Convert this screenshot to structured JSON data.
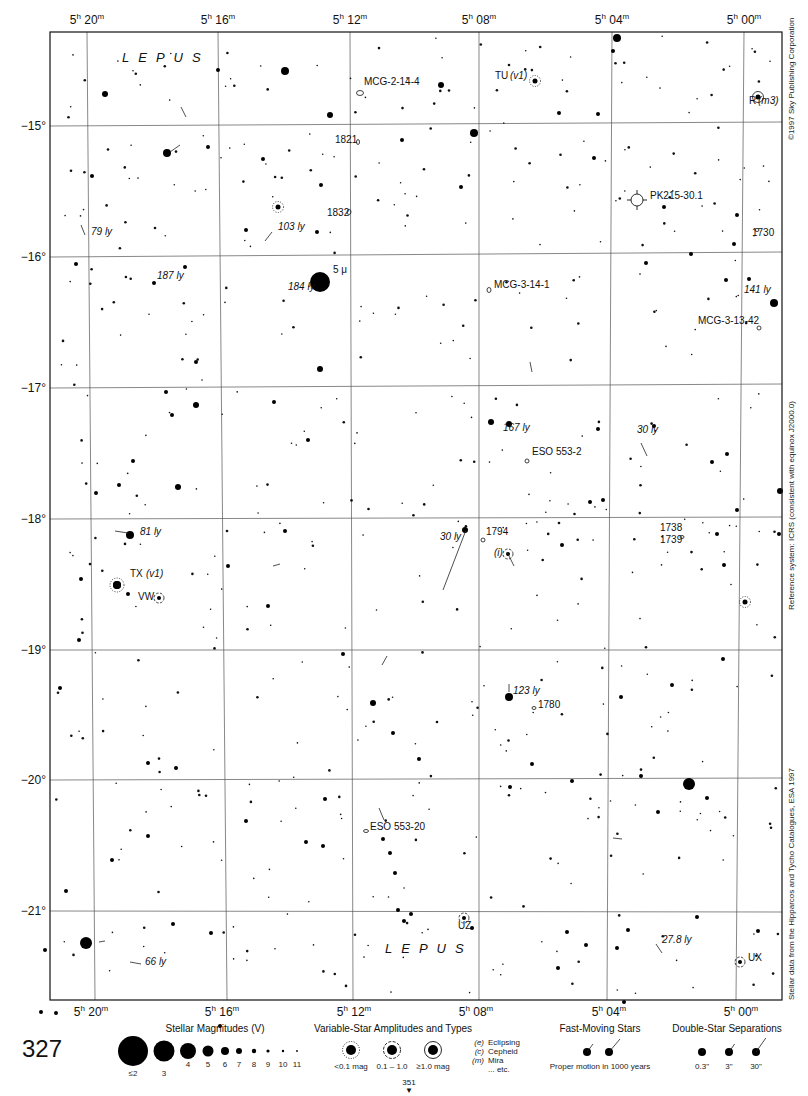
{
  "chart_data": {
    "type": "star-chart",
    "page_number": "327",
    "next_page": "351",
    "constellation": "LEPUS",
    "ra_labels": [
      {
        "h": "5",
        "m": "20",
        "x": 87
      },
      {
        "h": "5",
        "m": "16",
        "x": 218
      },
      {
        "h": "5",
        "m": "12",
        "x": 350
      },
      {
        "h": "5",
        "m": "08",
        "x": 479
      },
      {
        "h": "5",
        "m": "04",
        "x": 612
      },
      {
        "h": "5",
        "m": "00",
        "x": 744
      }
    ],
    "dec_labels": [
      {
        "label": "−15°",
        "y": 126
      },
      {
        "label": "−16°",
        "y": 257
      },
      {
        "label": "−17°",
        "y": 388
      },
      {
        "label": "−18°",
        "y": 519
      },
      {
        "label": "−19°",
        "y": 650
      },
      {
        "label": "−20°",
        "y": 780
      },
      {
        "label": "−21°",
        "y": 911
      }
    ],
    "frame": {
      "x": 50,
      "y": 32,
      "w": 732,
      "h": 968
    },
    "labels": [
      {
        "text": "LEPUS",
        "x": 122,
        "y": 50,
        "type": "constellation"
      },
      {
        "text": "LEPUS",
        "x": 385,
        "y": 941,
        "type": "constellation"
      },
      {
        "text": "MCG-2-14-4",
        "x": 364,
        "y": 82,
        "italic": false
      },
      {
        "text": "TU",
        "x": 495,
        "y": 76,
        "italic": false
      },
      {
        "text": "(v1)",
        "x": 510,
        "y": 76,
        "italic": true
      },
      {
        "text": "R",
        "x": 749,
        "y": 101,
        "italic": false
      },
      {
        "text": "(m3)",
        "x": 758,
        "y": 101,
        "italic": true
      },
      {
        "text": "1821",
        "x": 335,
        "y": 140,
        "italic": false
      },
      {
        "text": "1832",
        "x": 327,
        "y": 213,
        "italic": false
      },
      {
        "text": "PK215-30.1",
        "x": 650,
        "y": 196,
        "italic": false
      },
      {
        "text": "1730",
        "x": 752,
        "y": 233,
        "italic": false
      },
      {
        "text": "79 ly",
        "x": 91,
        "y": 232,
        "italic": true
      },
      {
        "text": "103 ly",
        "x": 278,
        "y": 227,
        "italic": true
      },
      {
        "text": "5 μ",
        "x": 333,
        "y": 270,
        "italic": false
      },
      {
        "text": "184 ly",
        "x": 288,
        "y": 287,
        "italic": true
      },
      {
        "text": "187 ly",
        "x": 157,
        "y": 276,
        "italic": true
      },
      {
        "text": "MCG-3-14-1",
        "x": 494,
        "y": 285,
        "italic": false
      },
      {
        "text": "141 ly",
        "x": 744,
        "y": 290,
        "italic": true
      },
      {
        "text": "MCG-3-13-42",
        "x": 698,
        "y": 321,
        "italic": false
      },
      {
        "text": "167 ly",
        "x": 503,
        "y": 428,
        "italic": true
      },
      {
        "text": "30 ly",
        "x": 637,
        "y": 430,
        "italic": true
      },
      {
        "text": "ESO 553-2",
        "x": 532,
        "y": 452,
        "italic": false
      },
      {
        "text": "81 ly",
        "x": 140,
        "y": 532,
        "italic": true
      },
      {
        "text": "30 ly",
        "x": 440,
        "y": 537,
        "italic": true
      },
      {
        "text": "1794",
        "x": 486,
        "y": 532,
        "italic": false
      },
      {
        "text": "(i)",
        "x": 494,
        "y": 553,
        "italic": true
      },
      {
        "text": "1738",
        "x": 660,
        "y": 528,
        "italic": false
      },
      {
        "text": "1739",
        "x": 660,
        "y": 540,
        "italic": false
      },
      {
        "text": "TX",
        "x": 130,
        "y": 574,
        "italic": false
      },
      {
        "text": "(v1)",
        "x": 146,
        "y": 574,
        "italic": true
      },
      {
        "text": "VW",
        "x": 138,
        "y": 597,
        "italic": false
      },
      {
        "text": "123 ly",
        "x": 513,
        "y": 691,
        "italic": true
      },
      {
        "text": "1780",
        "x": 538,
        "y": 705,
        "italic": false
      },
      {
        "text": "ESO 553-20",
        "x": 370,
        "y": 827,
        "italic": false
      },
      {
        "text": "UZ",
        "x": 458,
        "y": 926,
        "italic": false
      },
      {
        "text": "27.8 ly",
        "x": 662,
        "y": 940,
        "italic": true
      },
      {
        "text": "66 ly",
        "x": 145,
        "y": 962,
        "italic": true
      },
      {
        "text": "UX",
        "x": 748,
        "y": 958,
        "italic": false
      }
    ],
    "stars": [
      [
        320,
        282,
        10
      ],
      [
        689,
        784,
        6
      ],
      [
        86,
        943,
        6
      ],
      [
        285,
        71,
        4
      ],
      [
        167,
        153,
        4
      ],
      [
        474,
        133,
        4
      ],
      [
        617,
        38,
        4
      ],
      [
        774,
        303,
        4
      ],
      [
        130,
        535,
        4
      ],
      [
        117,
        585,
        4
      ],
      [
        509,
        697,
        4
      ],
      [
        178,
        487,
        3
      ],
      [
        196,
        405,
        3
      ],
      [
        320,
        369,
        3
      ],
      [
        491,
        422,
        3
      ],
      [
        509,
        424,
        3
      ],
      [
        780,
        491,
        3
      ],
      [
        465,
        530,
        3
      ],
      [
        373,
        703,
        3
      ],
      [
        441,
        85,
        3
      ],
      [
        330,
        115,
        3
      ],
      [
        105,
        94,
        3
      ],
      [
        218,
        70,
        2
      ],
      [
        598,
        114,
        2
      ],
      [
        613,
        51,
        2
      ],
      [
        559,
        113,
        2
      ],
      [
        594,
        158,
        2
      ],
      [
        461,
        187,
        2
      ],
      [
        646,
        263,
        2
      ],
      [
        726,
        280,
        2
      ],
      [
        664,
        207,
        2
      ],
      [
        749,
        279,
        2
      ],
      [
        691,
        254,
        2
      ],
      [
        737,
        215,
        2
      ],
      [
        734,
        244,
        2
      ],
      [
        402,
        140,
        2
      ],
      [
        321,
        185,
        2
      ],
      [
        263,
        159,
        2
      ],
      [
        92,
        176,
        2
      ],
      [
        246,
        230,
        2
      ],
      [
        317,
        232,
        2
      ],
      [
        154,
        283,
        2
      ],
      [
        76,
        264,
        2
      ],
      [
        208,
        147,
        2
      ],
      [
        185,
        267,
        2
      ],
      [
        166,
        392,
        2
      ],
      [
        196,
        362,
        2
      ],
      [
        172,
        415,
        2
      ],
      [
        133,
        461,
        2
      ],
      [
        119,
        485,
        2
      ],
      [
        308,
        440,
        2
      ],
      [
        285,
        531,
        2
      ],
      [
        274,
        402,
        2
      ],
      [
        96,
        493,
        2
      ],
      [
        268,
        606,
        2
      ],
      [
        228,
        566,
        2
      ],
      [
        343,
        654,
        2
      ],
      [
        393,
        733,
        2
      ],
      [
        419,
        759,
        2
      ],
      [
        532,
        764,
        2
      ],
      [
        510,
        787,
        2
      ],
      [
        572,
        781,
        2
      ],
      [
        390,
        853,
        2
      ],
      [
        404,
        921,
        2
      ],
      [
        472,
        928,
        2
      ],
      [
        567,
        932,
        2
      ],
      [
        586,
        945,
        2
      ],
      [
        558,
        968,
        2
      ],
      [
        628,
        930,
        2
      ],
      [
        617,
        948,
        2
      ],
      [
        697,
        917,
        2
      ],
      [
        624,
        1002,
        2
      ],
      [
        758,
        931,
        2
      ],
      [
        658,
        812,
        2
      ],
      [
        707,
        798,
        2
      ],
      [
        672,
        685,
        2
      ],
      [
        641,
        776,
        2
      ],
      [
        723,
        659,
        2
      ],
      [
        724,
        565,
        2
      ],
      [
        717,
        534,
        2
      ],
      [
        737,
        510,
        2
      ],
      [
        779,
        534,
        2
      ],
      [
        621,
        697,
        2
      ],
      [
        562,
        545,
        2
      ],
      [
        727,
        454,
        2
      ],
      [
        712,
        462,
        2
      ],
      [
        598,
        429,
        2
      ],
      [
        654,
        426,
        2
      ],
      [
        603,
        500,
        2
      ],
      [
        590,
        502,
        2
      ],
      [
        60,
        688,
        2
      ],
      [
        79,
        640,
        2
      ],
      [
        128,
        594,
        2
      ],
      [
        81,
        579,
        2
      ],
      [
        148,
        763,
        2
      ],
      [
        176,
        768,
        2
      ],
      [
        112,
        860,
        2
      ],
      [
        66,
        891,
        2
      ],
      [
        173,
        924,
        2
      ],
      [
        148,
        836,
        2
      ],
      [
        246,
        821,
        2
      ],
      [
        306,
        842,
        2
      ],
      [
        323,
        846,
        2
      ],
      [
        325,
        799,
        2
      ],
      [
        383,
        839,
        2
      ],
      [
        395,
        873,
        2
      ],
      [
        398,
        910,
        2
      ],
      [
        411,
        914,
        2
      ],
      [
        211,
        933,
        2
      ],
      [
        220,
        1026,
        2
      ],
      [
        56,
        1013,
        2
      ],
      [
        45,
        950,
        2
      ],
      [
        41,
        1012,
        2
      ]
    ],
    "faint_stars_seed": 327,
    "grid": {
      "verticals": [
        [
          87,
          32,
          95,
          1000
        ],
        [
          218,
          32,
          227,
          1000
        ],
        [
          350,
          32,
          353,
          1000
        ],
        [
          479,
          32,
          479,
          1000
        ],
        [
          612,
          32,
          607,
          1000
        ],
        [
          744,
          32,
          736,
          1000
        ]
      ],
      "horizontals": [
        [
          50,
          126,
          782,
          122
        ],
        [
          50,
          257,
          782,
          252
        ],
        [
          50,
          388,
          782,
          384
        ],
        [
          50,
          519,
          782,
          517
        ],
        [
          50,
          650,
          782,
          650
        ],
        [
          50,
          780,
          782,
          778
        ],
        [
          50,
          911,
          782,
          912
        ]
      ]
    },
    "variables": [
      {
        "x": 535,
        "y": 81,
        "r": 2.5,
        "style": "dotted"
      },
      {
        "x": 278,
        "y": 207,
        "r": 2.5,
        "style": "dotted"
      },
      {
        "x": 117,
        "y": 585,
        "r": 4,
        "style": "dotted"
      },
      {
        "x": 159,
        "y": 598,
        "r": 2,
        "style": "dashed"
      },
      {
        "x": 745,
        "y": 602,
        "r": 2.5,
        "style": "dotted"
      },
      {
        "x": 758,
        "y": 97,
        "r": 2.5,
        "style": "ring"
      },
      {
        "x": 508,
        "y": 554,
        "r": 2,
        "style": "dashed"
      },
      {
        "x": 464,
        "y": 918,
        "r": 2,
        "style": "dashed"
      },
      {
        "x": 740,
        "y": 962,
        "r": 2,
        "style": "dashed"
      }
    ],
    "nebulae": [
      {
        "x": 637,
        "y": 200,
        "r": 6,
        "type": "planetary"
      }
    ],
    "galaxies": [
      {
        "x": 360,
        "y": 93,
        "rx": 3.5,
        "ry": 2.5
      },
      {
        "x": 358,
        "y": 142,
        "rx": 1.5,
        "ry": 2.5
      },
      {
        "x": 349,
        "y": 212,
        "rx": 2,
        "ry": 2.5
      },
      {
        "x": 489,
        "y": 290,
        "rx": 2,
        "ry": 2.5
      },
      {
        "x": 759,
        "y": 328,
        "rx": 2,
        "ry": 2
      },
      {
        "x": 527,
        "y": 461,
        "rx": 2,
        "ry": 2
      },
      {
        "x": 483,
        "y": 540,
        "rx": 2,
        "ry": 2
      },
      {
        "x": 682,
        "y": 537,
        "rx": 2,
        "ry": 1.5
      },
      {
        "x": 534,
        "y": 708,
        "rx": 2,
        "ry": 1.5
      },
      {
        "x": 366,
        "y": 831,
        "rx": 2.5,
        "ry": 1.5
      },
      {
        "x": 757,
        "y": 230,
        "rx": 2,
        "ry": 1.5
      }
    ],
    "motion_vectors": [
      [
        186,
        117,
        181,
        107
      ],
      [
        170,
        152,
        180,
        145
      ],
      [
        85,
        235,
        81,
        225
      ],
      [
        272,
        232,
        265,
        241
      ],
      [
        128,
        533,
        115,
        531
      ],
      [
        273,
        566,
        280,
        564
      ],
      [
        466,
        530,
        443,
        590
      ],
      [
        530,
        362,
        532,
        372
      ],
      [
        641,
        443,
        647,
        456
      ],
      [
        507,
        552,
        514,
        566
      ],
      [
        382,
        665,
        387,
        656
      ],
      [
        99,
        942,
        105,
        941
      ],
      [
        141,
        964,
        130,
        962
      ],
      [
        656,
        944,
        662,
        953
      ],
      [
        613,
        838,
        622,
        839
      ],
      [
        379,
        808,
        384,
        820
      ],
      [
        509,
        684,
        509,
        692
      ]
    ],
    "side_texts": [
      {
        "text": "©1997 Sky Publishing Corporation",
        "x": 787,
        "y": 140
      },
      {
        "text": "Reference system: ICRS (consistent with equinox J2000.0)",
        "x": 787,
        "y": 610
      },
      {
        "text": "Stellar data from the Hipparcos and Tycho Catalogues, ESA 1997",
        "x": 787,
        "y": 1000
      }
    ]
  },
  "legend": {
    "page_number": "327",
    "magnitudes": {
      "title": "Stellar Magnitudes (V)",
      "items": [
        {
          "label": "≤2",
          "r": 15,
          "x": 133
        },
        {
          "label": "3",
          "r": 10.5,
          "x": 164
        },
        {
          "label": "4",
          "r": 8,
          "x": 188
        },
        {
          "label": "5",
          "r": 5.5,
          "x": 208
        },
        {
          "label": "6",
          "r": 4,
          "x": 225
        },
        {
          "label": "7",
          "r": 3,
          "x": 239
        },
        {
          "label": "8",
          "r": 2.2,
          "x": 254
        },
        {
          "label": "9",
          "r": 1.6,
          "x": 268
        },
        {
          "label": "10",
          "r": 1.2,
          "x": 283
        },
        {
          "label": "11",
          "r": 0.9,
          "x": 297
        }
      ]
    },
    "variables": {
      "title": "Variable-Star Amplitudes and Types",
      "items": [
        {
          "label": "<0.1 mag",
          "style": "dotted",
          "x": 351
        },
        {
          "label": "0.1 – 1.0",
          "style": "dashed",
          "x": 392
        },
        {
          "label": "≥1.0 mag",
          "style": "ring",
          "x": 433
        }
      ],
      "types": [
        {
          "code": "(e)",
          "name": "Eclipsing"
        },
        {
          "code": "(c)",
          "name": "Cepheid"
        },
        {
          "code": "(m)",
          "name": "Mira"
        },
        {
          "code": "",
          "name": "... etc."
        }
      ]
    },
    "fast_moving": {
      "title": "Fast-Moving Stars",
      "caption": "Proper motion in 1000 years"
    },
    "double_stars": {
      "title": "Double-Star Separations",
      "items": [
        {
          "label": "0.3\"",
          "x": 702
        },
        {
          "label": "3\"",
          "x": 729
        },
        {
          "label": "30\"",
          "x": 756
        }
      ]
    },
    "next_page": "351"
  }
}
